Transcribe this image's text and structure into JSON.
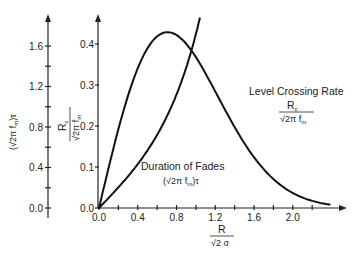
{
  "chart_data": {
    "type": "line",
    "title": "",
    "xlabel": "R / (√2 σ)",
    "ylabel_left": "(√2π fm)τ",
    "ylabel_right": "Rc / (√2π fm)",
    "x_axis": {
      "range": [
        0,
        2.5
      ],
      "ticks": [
        0.0,
        0.2,
        0.4,
        0.6,
        0.8,
        1.0,
        1.2,
        1.4,
        1.6,
        1.8,
        2.0,
        2.2
      ],
      "tick_labels": [
        "0.0",
        "0.4",
        "0.8",
        "1.2",
        "1.6",
        "2.0"
      ],
      "label_numerator": "R",
      "label_denominator_root": "2",
      "label_denominator_tail": "σ"
    },
    "y_axis_left": {
      "range": [
        0,
        1.8
      ],
      "ticks": [
        0.0,
        0.2,
        0.4,
        0.6,
        0.8,
        1.0,
        1.2,
        1.4,
        1.6
      ],
      "tick_labels": [
        "0.0",
        "0.4",
        "0.8",
        "1.2",
        "1.6"
      ],
      "label": "(√2π fm)τ"
    },
    "y_axis_right": {
      "range": [
        0,
        0.45
      ],
      "ticks": [
        0.0,
        0.1,
        0.2,
        0.3,
        0.4
      ],
      "tick_labels": [
        "0.0",
        "0.1",
        "0.2",
        "0.3",
        "0.4"
      ],
      "label_numerator": "R",
      "label_numerator_sub": "c",
      "label_denominator": "√2π f",
      "label_denominator_sub": "m"
    },
    "series": [
      {
        "name": "Level Crossing Rate",
        "formula_label_numerator": "R",
        "formula_label_numerator_sub": "c",
        "formula_label_denominator": "√2π f",
        "formula_label_denominator_sub": "m",
        "axis": "right",
        "x": [
          0.0,
          0.1,
          0.2,
          0.3,
          0.4,
          0.5,
          0.6,
          0.7,
          0.8,
          0.9,
          1.0,
          1.1,
          1.2,
          1.3,
          1.4,
          1.5,
          1.6,
          1.7,
          1.8,
          1.9,
          2.0,
          2.1,
          2.2,
          2.3,
          2.38
        ],
        "values": [
          0.0,
          0.099,
          0.192,
          0.274,
          0.341,
          0.389,
          0.419,
          0.429,
          0.422,
          0.4,
          0.368,
          0.328,
          0.284,
          0.24,
          0.197,
          0.158,
          0.123,
          0.095,
          0.07,
          0.051,
          0.037,
          0.026,
          0.017,
          0.012,
          0.008
        ]
      },
      {
        "name": "Duration of Fades",
        "formula_label": "(√2π fm)τ",
        "axis": "left",
        "x": [
          0.0,
          0.1,
          0.2,
          0.3,
          0.4,
          0.5,
          0.6,
          0.7,
          0.8,
          0.9,
          1.0,
          1.04
        ],
        "values": [
          0.0,
          0.1,
          0.204,
          0.314,
          0.433,
          0.568,
          0.722,
          0.903,
          1.12,
          1.386,
          1.718,
          1.874
        ]
      }
    ],
    "annotations": [
      {
        "text": "Level Crossing Rate",
        "x": 1.75,
        "y_right": 0.31
      },
      {
        "text": "Duration of Fades",
        "x": 0.9,
        "y_left": 0.52
      }
    ],
    "grid": false,
    "legend": "none (inline annotations)"
  },
  "labels": {
    "lcr_title": "Level Crossing Rate",
    "lcr_num": "R",
    "lcr_num_sub": "c",
    "lcr_den": "√2π f",
    "lcr_den_sub": "m",
    "dof_title": "Duration of Fades",
    "dof_formula_pre": "(√2π f",
    "dof_formula_sub": "m",
    "dof_formula_post": ")τ",
    "x_num": "R",
    "x_den": "√2 σ",
    "left_pre": "(√2π f",
    "left_sub": "m",
    "left_post": ")τ",
    "right_num": "R",
    "right_num_sub": "c",
    "right_den": "√2π f",
    "right_den_sub": "m"
  }
}
